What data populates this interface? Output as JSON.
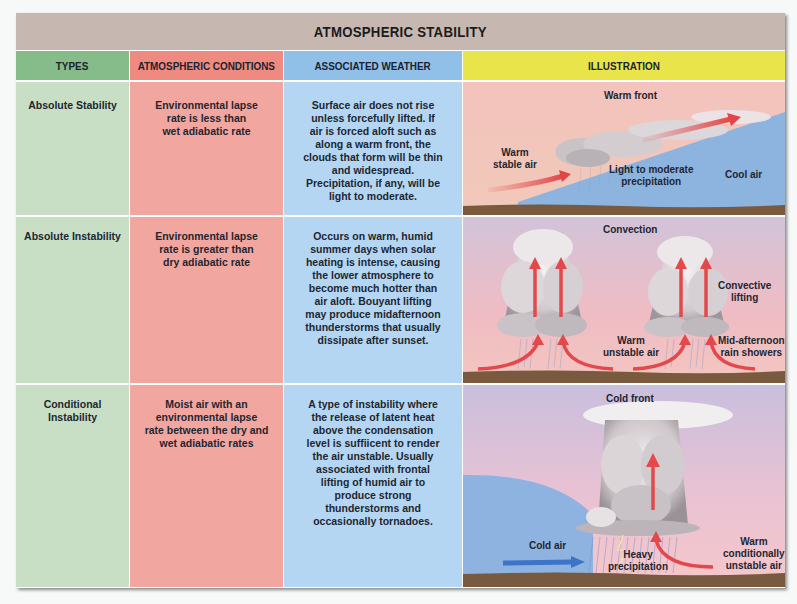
{
  "title": "ATMOSPHERIC STABILITY",
  "headers": {
    "types": "TYPES",
    "conditions": "ATMOSPHERIC CONDITIONS",
    "weather": "ASSOCIATED WEATHER",
    "illustration": "ILLUSTRATION"
  },
  "colors": {
    "title_bg": "#c6b8b1",
    "types_header": "#86bb8a",
    "conditions_header": "#ef8a80",
    "weather_header": "#90bfe8",
    "illustration_header": "#e9e449",
    "types_cell": "#c8dfc6",
    "conditions_cell": "#f2a6a0",
    "weather_cell": "#b4d6f3"
  },
  "rows": [
    {
      "type": "Absolute Stability",
      "conditions": [
        "Environmental lapse",
        "rate is less than",
        "wet adiabatic rate"
      ],
      "weather": [
        "Surface air does not rise",
        "unless forcefully lifted. If",
        "air is forced aloft such as",
        "along a warm front, the",
        "clouds that form will be thin",
        "and widespread.",
        "Precipitation, if any, will be",
        "light to moderate."
      ],
      "illustration": {
        "title": "Warm front",
        "labels": [
          "Warm stable air",
          "Light to moderate precipitation",
          "Cool air"
        ],
        "warm_label_1": "Warm",
        "warm_label_2": "stable air",
        "precip_label_1": "Light to moderate",
        "precip_label_2": "precipitation",
        "cool_label": "Cool air"
      }
    },
    {
      "type": "Absolute Instability",
      "conditions": [
        "Environmental lapse",
        "rate is greater than",
        "dry adiabatic rate"
      ],
      "weather": [
        "Occurs on warm, humid",
        "summer days when solar",
        "heating is intense, causing",
        "the lower atmosphere to",
        "become much hotter than",
        "air aloft. Bouyant lifting",
        "may produce midafternoon",
        "thunderstorms that usually",
        "dissipate after sunset."
      ],
      "illustration": {
        "title": "Convection",
        "labels": [
          "Convective lifting",
          "Warm unstable air",
          "Mid-afternoon rain showers"
        ],
        "convective_1": "Convective",
        "convective_2": "lifting",
        "warm_1": "Warm",
        "warm_2": "unstable air",
        "showers_1": "Mid-afternoon",
        "showers_2": "rain showers"
      }
    },
    {
      "type": "Conditional Instability",
      "conditions": [
        "Moist air with an",
        "environmental lapse",
        "rate between the dry and",
        "wet adiabatic rates"
      ],
      "weather": [
        "A type of instability where",
        "the release of latent heat",
        "above the condensation",
        "level is suffiicent to render",
        "the air unstable. Usually",
        "associated with frontal",
        "lifting of humid air to",
        "produce strong",
        "thunderstorms and",
        "occasionally tornadoes."
      ],
      "illustration": {
        "title": "Cold front",
        "labels": [
          "Cold air",
          "Heavy precipitation",
          "Warm conditionally unstable air"
        ],
        "cold_label": "Cold air",
        "heavy_1": "Heavy",
        "heavy_2": "precipitation",
        "warm_1": "Warm",
        "warm_2": "conditionally",
        "warm_3": "unstable air"
      }
    }
  ]
}
